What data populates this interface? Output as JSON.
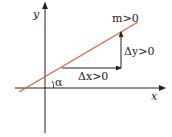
{
  "diagram": {
    "axes": {
      "x_label": "x",
      "y_label": "y"
    },
    "line": {
      "color": "#e0643c",
      "label": "m>0"
    },
    "delta_x": {
      "label": "Δx>0"
    },
    "delta_y": {
      "label": "Δy>0"
    },
    "angle": {
      "label": "α"
    },
    "colors": {
      "axis": "#222222",
      "line": "#e0643c",
      "arrow": "#222222"
    }
  }
}
